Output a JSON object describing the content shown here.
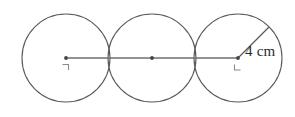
{
  "figure": {
    "background_color": "#ffffff",
    "stroke_color": "#5a5a5a",
    "axis_color": "#6e6e6e",
    "label_color": "#2b2b2b",
    "width": 295,
    "height": 117
  },
  "measurement": {
    "radius_label": "4 cm",
    "radius_value": 4,
    "unit": "cm"
  },
  "circles": [
    {
      "name": "left-circle",
      "cx": 66,
      "cy": 58,
      "r": 44
    },
    {
      "name": "middle-circle",
      "cx": 152,
      "cy": 58,
      "r": 44
    },
    {
      "name": "right-circle",
      "cx": 238,
      "cy": 58,
      "r": 44
    }
  ],
  "centers": [
    {
      "name": "left-center-point",
      "cx": 66,
      "cy": 58,
      "has_label_mark": true
    },
    {
      "name": "middle-center-point",
      "cx": 152,
      "cy": 58,
      "has_label_mark": false
    },
    {
      "name": "right-center-point",
      "cx": 238,
      "cy": 58,
      "has_label_mark": true
    }
  ],
  "center_line": {
    "name": "center-axis-line",
    "x1": 66,
    "y1": 58,
    "x2": 238,
    "y2": 58
  },
  "radius_segment": {
    "name": "radius-segment",
    "x1": 238,
    "y1": 58,
    "x2": 269,
    "y2": 27
  },
  "label_position": {
    "left": 245,
    "top": 44
  }
}
